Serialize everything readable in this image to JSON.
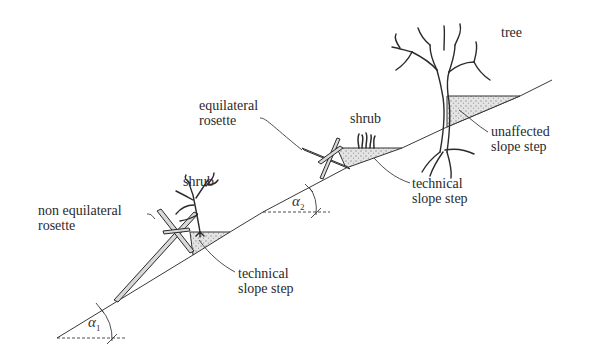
{
  "diagram": {
    "type": "slope-stabilization-cross-section",
    "colors": {
      "ink": "#2a2a2a",
      "fill_stipple": "#bdbdbd",
      "background": "#ffffff"
    },
    "labels": {
      "tree": "tree",
      "shrub_upper": "shrub",
      "shrub_lower": "shrub",
      "equilateral_rosette": [
        "equilateral",
        "rosette"
      ],
      "non_equilateral_rosette": [
        "non equilateral",
        "rosette"
      ],
      "technical_step_upper": [
        "technical",
        "slope step"
      ],
      "technical_step_lower": [
        "technical",
        "slope step"
      ],
      "unaffected_step": [
        "unaffected",
        "slope step"
      ]
    },
    "angles": [
      {
        "symbol": "α",
        "subscript": "1"
      },
      {
        "symbol": "α",
        "subscript": "2"
      }
    ]
  }
}
